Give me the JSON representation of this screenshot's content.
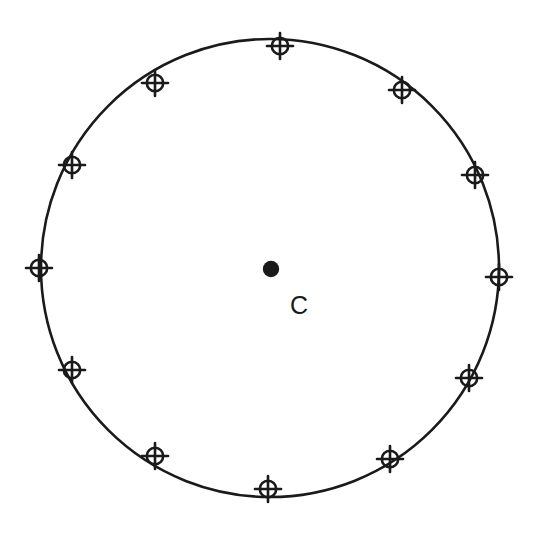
{
  "figure": {
    "background_color": "#ffffff",
    "stroke_color": "#1a1a1a",
    "fill_color": "#1a1a1a",
    "canvas": {
      "width": 540,
      "height": 533
    }
  },
  "circle": {
    "name": "main-circle",
    "center_x": 270,
    "center_y": 268,
    "radius": 229,
    "stroke_width": 2.6,
    "stroke_color": "#1a1a1a",
    "fill": "none"
  },
  "center_point": {
    "name": "center-point",
    "x": 271,
    "y": 269,
    "radius": 8.2,
    "fill_color": "#1a1a1a",
    "label": "C",
    "label_x": 299,
    "label_y": 314,
    "label_font_size": 25
  },
  "markers": {
    "count": 12,
    "symbol": "crosshair-circle",
    "outer_radius": 8.2,
    "tick_extent": 13,
    "stroke_width": 2.6,
    "stroke_color": "#1a1a1a",
    "angle_step_degrees": 30,
    "start_angle_degrees": -90,
    "items": [
      {
        "label": "marker-12-oclock",
        "angle": -90,
        "x": 280,
        "y": 46,
        "clock": "12"
      },
      {
        "label": "marker-1-oclock",
        "angle": -60,
        "x": 402,
        "y": 90,
        "clock": "1"
      },
      {
        "label": "marker-2-oclock",
        "angle": -30,
        "x": 475,
        "y": 175,
        "clock": "2"
      },
      {
        "label": "marker-3-oclock",
        "angle": 0,
        "x": 499,
        "y": 277,
        "clock": "3"
      },
      {
        "label": "marker-4-oclock",
        "angle": 30,
        "x": 469,
        "y": 378,
        "clock": "4"
      },
      {
        "label": "marker-5-oclock",
        "angle": 60,
        "x": 390,
        "y": 459,
        "clock": "5"
      },
      {
        "label": "marker-6-oclock",
        "angle": 90,
        "x": 268,
        "y": 489,
        "clock": "6"
      },
      {
        "label": "marker-7-oclock",
        "angle": 120,
        "x": 155,
        "y": 456,
        "clock": "7"
      },
      {
        "label": "marker-8-oclock",
        "angle": 150,
        "x": 72,
        "y": 370,
        "clock": "8"
      },
      {
        "label": "marker-9-oclock",
        "angle": 180,
        "x": 39,
        "y": 268,
        "clock": "9"
      },
      {
        "label": "marker-10-oclock",
        "angle": 210,
        "x": 72,
        "y": 165,
        "clock": "10"
      },
      {
        "label": "marker-11-oclock",
        "angle": 240,
        "x": 155,
        "y": 83,
        "clock": "11"
      }
    ]
  }
}
